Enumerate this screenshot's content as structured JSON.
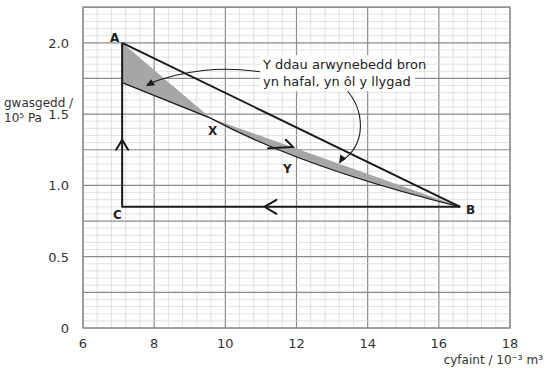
{
  "chart_data": {
    "type": "line",
    "title": "",
    "xlabel": "cyfaint / 10⁻³ m³",
    "ylabel_line1": "gwasgedd /",
    "ylabel_line2": "10⁵ Pa",
    "xlim": [
      6,
      18
    ],
    "ylim": [
      0,
      2.25
    ],
    "x_ticks": [
      6,
      8,
      10,
      12,
      14,
      16,
      18
    ],
    "x_tick_labels": [
      "6",
      "8",
      "10",
      "12",
      "14",
      "16",
      "18"
    ],
    "y_ticks": [
      0,
      0.5,
      1.0,
      1.5,
      2.0
    ],
    "y_tick_labels": [
      "0",
      "0.5",
      "1.0",
      "1.5",
      "2.0"
    ],
    "grid": true,
    "grid_minor_step_x": 0.4,
    "grid_minor_step_y": 0.05,
    "points": {
      "A": {
        "x": 7.1,
        "y": 2.0
      },
      "B": {
        "x": 16.6,
        "y": 0.85
      },
      "C": {
        "x": 7.1,
        "y": 0.85
      },
      "X": {
        "x": 9.6,
        "y": 1.47
      },
      "Y": {
        "x": 11.9,
        "y": 1.22
      }
    },
    "series": [
      {
        "name": "A to B straight line (via X)",
        "style": "straight",
        "x": [
          7.1,
          9.6,
          16.6
        ],
        "y": [
          2.0,
          1.47,
          0.85
        ]
      },
      {
        "name": "curve through X and Y (lower path B to A)",
        "style": "curve",
        "x": [
          7.1,
          9.6,
          11.9,
          16.6
        ],
        "y": [
          1.72,
          1.47,
          1.22,
          0.85
        ]
      },
      {
        "name": "B to C",
        "style": "straight",
        "x": [
          16.6,
          7.1
        ],
        "y": [
          0.85,
          0.85
        ]
      },
      {
        "name": "C to A",
        "style": "straight",
        "x": [
          7.1,
          7.1
        ],
        "y": [
          0.85,
          2.0
        ]
      }
    ],
    "shaded_regions": [
      "between line A-X and curve (upper-left lobe)",
      "between line X-B and curve through Y (lower-right lobe)"
    ],
    "annotations": [
      {
        "text_line1": "Y ddau arwynebedd bron",
        "text_line2": "yn hafal, yn ôl y llygad",
        "arrows_to": [
          "upper-left shaded lobe",
          "lower-right shaded lobe"
        ]
      }
    ],
    "direction_arrows": [
      "up on C-A",
      "left on B-C",
      "right-down on X-Y curve"
    ]
  },
  "labels": {
    "A": "A",
    "B": "B",
    "C": "C",
    "X": "X",
    "Y": "Y"
  },
  "colors": {
    "grid_minor": "#cfcfcf",
    "grid_major": "#8a8a8a",
    "line": "#1a1a1a",
    "shade": "#a6a6a6"
  }
}
